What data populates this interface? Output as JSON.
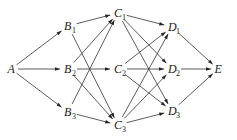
{
  "diagram": {
    "type": "directed-layered-graph",
    "nodes": [
      {
        "id": "A",
        "letter": "A",
        "sub": "",
        "x": 11,
        "y": 69
      },
      {
        "id": "B1",
        "letter": "B",
        "sub": "1",
        "x": 68,
        "y": 26
      },
      {
        "id": "B2",
        "letter": "B",
        "sub": "2",
        "x": 68,
        "y": 69
      },
      {
        "id": "B3",
        "letter": "B",
        "sub": "3",
        "x": 68,
        "y": 112
      },
      {
        "id": "C1",
        "letter": "C",
        "sub": "1",
        "x": 118,
        "y": 13
      },
      {
        "id": "C2",
        "letter": "C",
        "sub": "2",
        "x": 118,
        "y": 69
      },
      {
        "id": "C3",
        "letter": "C",
        "sub": "3",
        "x": 118,
        "y": 125
      },
      {
        "id": "D1",
        "letter": "D",
        "sub": "1",
        "x": 172,
        "y": 27
      },
      {
        "id": "D2",
        "letter": "D",
        "sub": "2",
        "x": 172,
        "y": 69
      },
      {
        "id": "D3",
        "letter": "D",
        "sub": "3",
        "x": 172,
        "y": 111
      },
      {
        "id": "E",
        "letter": "E",
        "sub": "",
        "x": 218,
        "y": 69
      }
    ],
    "edges": [
      [
        "A",
        "B1"
      ],
      [
        "A",
        "B2"
      ],
      [
        "A",
        "B3"
      ],
      [
        "B1",
        "C1"
      ],
      [
        "B1",
        "C3"
      ],
      [
        "B2",
        "C1"
      ],
      [
        "B2",
        "C2"
      ],
      [
        "B2",
        "C3"
      ],
      [
        "B3",
        "C1"
      ],
      [
        "B3",
        "C3"
      ],
      [
        "C1",
        "D1"
      ],
      [
        "C1",
        "D2"
      ],
      [
        "C1",
        "D3"
      ],
      [
        "C2",
        "D1"
      ],
      [
        "C2",
        "D2"
      ],
      [
        "C2",
        "D3"
      ],
      [
        "C3",
        "D1"
      ],
      [
        "C3",
        "D2"
      ],
      [
        "C3",
        "D3"
      ],
      [
        "D1",
        "E"
      ],
      [
        "D2",
        "E"
      ],
      [
        "D3",
        "E"
      ]
    ],
    "colors": {
      "line": "#333333",
      "text": "#222222",
      "background": "#ffffff"
    }
  }
}
